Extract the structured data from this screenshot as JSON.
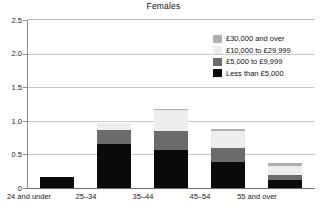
{
  "chart_data": {
    "type": "bar",
    "subtype": "stacked-vertical",
    "title": "Females",
    "xlabel": "",
    "ylabel": "",
    "ylim": [
      0,
      2.5
    ],
    "yticks": [
      "0",
      "0.5",
      "1.0",
      "1.5",
      "2.0",
      "2.5"
    ],
    "ytick_values": [
      0,
      0.5,
      1.0,
      1.5,
      2.0,
      2.5
    ],
    "grid": "horizontal",
    "legend_position": "inside-top-right",
    "categories": [
      "24 and under",
      "25–34",
      "35–44",
      "45–54",
      "55 and over"
    ],
    "series": [
      {
        "name": "Less than £5,000",
        "color": "#0a0a0a",
        "values": [
          0.16,
          0.65,
          0.57,
          0.39,
          0.12
        ]
      },
      {
        "name": "£5,000 to £9,999",
        "color": "#6b6b6b",
        "values": [
          0.0,
          0.21,
          0.28,
          0.2,
          0.07
        ]
      },
      {
        "name": "£10,000 to £29,999",
        "color": "#ededed",
        "values": [
          0.0,
          0.11,
          0.31,
          0.26,
          0.14
        ]
      },
      {
        "name": "£30,000 and over",
        "color": "#b0b0b0",
        "values": [
          0.0,
          0.0,
          0.02,
          0.03,
          0.04
        ]
      }
    ],
    "totals": [
      0.16,
      0.97,
      1.18,
      0.88,
      0.37
    ]
  },
  "legend": {
    "items": [
      {
        "label": "£30,000 and over",
        "color": "#b0b0b0"
      },
      {
        "label": "£10,000 to £29,999",
        "color": "#ededed"
      },
      {
        "label": "£5,000 to £9,999",
        "color": "#6b6b6b"
      },
      {
        "label": "Less than £5,000",
        "color": "#0a0a0a"
      }
    ]
  },
  "axis": {
    "y_labels": [
      "2.5",
      "2.0",
      "1.5",
      "1.0",
      "0.5",
      "0"
    ],
    "x_labels": [
      "24 and under",
      "25–34",
      "35–44",
      "45–54",
      "55 and over"
    ]
  }
}
